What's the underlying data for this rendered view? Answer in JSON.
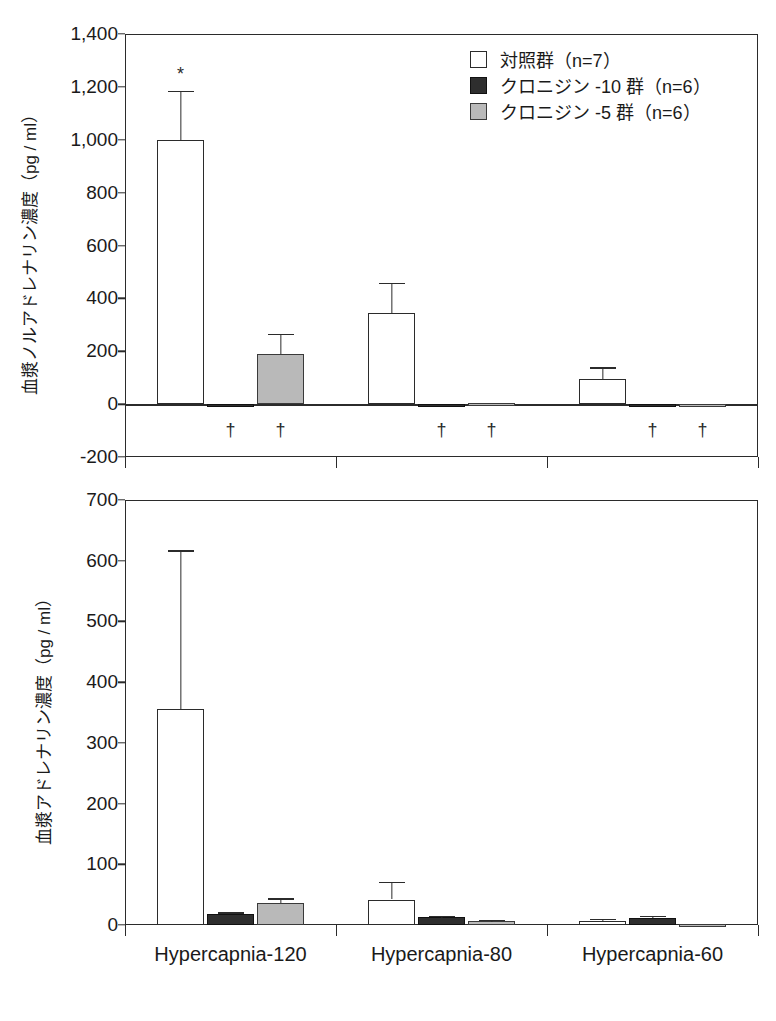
{
  "figure": {
    "series": [
      {
        "key": "control",
        "label": "対照群（n=7）",
        "swatch": "white-square-icon",
        "color": "#ffffff"
      },
      {
        "key": "c10",
        "label": "クロニジン -10 群（n=6）",
        "swatch": "black-square-icon",
        "color": "#2e2e2e"
      },
      {
        "key": "c5",
        "label": "クロニジン -5 群（n=6）",
        "swatch": "gray-square-icon",
        "color": "#b9b9b9"
      }
    ],
    "categories": [
      "Hypercapnia-120",
      "Hypercapnia-80",
      "Hypercapnia-60"
    ]
  },
  "chart_data": [
    {
      "type": "bar",
      "id": "noradrenaline",
      "title": "",
      "ylabel": "血漿ノルアドレナリン濃度（pg / ml）",
      "xlabel": "",
      "ylim": [
        -200,
        1400
      ],
      "yticks": [
        "1,400",
        "1,200",
        "1,000",
        "800",
        "600",
        "400",
        "200",
        "0",
        "-200"
      ],
      "ytick_values": [
        1400,
        1200,
        1000,
        800,
        600,
        400,
        200,
        0,
        -200
      ],
      "grid": false,
      "legend_position": "top-right",
      "categories": [
        "Hypercapnia-120",
        "Hypercapnia-80",
        "Hypercapnia-60"
      ],
      "series": [
        {
          "name": "対照群（n=7）",
          "key": "control",
          "values": [
            1000,
            345,
            95
          ],
          "errors": [
            185,
            113,
            45
          ],
          "annotations": [
            "*",
            "",
            ""
          ]
        },
        {
          "name": "クロニジン -10 群（n=6）",
          "key": "c10",
          "values": [
            -6,
            -5,
            -8
          ],
          "errors": [
            0,
            0,
            0
          ],
          "annotations": [
            "†",
            "†",
            "†"
          ]
        },
        {
          "name": "クロニジン -5 群（n=6）",
          "key": "c5",
          "values": [
            190,
            3,
            -5
          ],
          "errors": [
            75,
            0,
            0
          ],
          "annotations": [
            "†",
            "†",
            "†"
          ]
        }
      ]
    },
    {
      "type": "bar",
      "id": "adrenaline",
      "title": "",
      "ylabel": "血漿アドレナリン濃度（pg / ml）",
      "xlabel": "",
      "ylim": [
        0,
        700
      ],
      "yticks": [
        "700",
        "600",
        "500",
        "400",
        "300",
        "200",
        "100",
        "0"
      ],
      "ytick_values": [
        700,
        600,
        500,
        400,
        300,
        200,
        100,
        0
      ],
      "grid": false,
      "legend_position": "none",
      "categories": [
        "Hypercapnia-120",
        "Hypercapnia-80",
        "Hypercapnia-60"
      ],
      "series": [
        {
          "name": "対照群（n=7）",
          "key": "control",
          "values": [
            355,
            42,
            7
          ],
          "errors": [
            262,
            29,
            3
          ],
          "annotations": [
            "",
            "",
            ""
          ]
        },
        {
          "name": "クロニジン -10 群（n=6）",
          "key": "c10",
          "values": [
            18,
            13,
            12
          ],
          "errors": [
            3,
            2,
            3
          ],
          "annotations": [
            "",
            "",
            ""
          ]
        },
        {
          "name": "クロニジン -5 群（n=6）",
          "key": "c5",
          "values": [
            36,
            7,
            2
          ],
          "errors": [
            8,
            2,
            0
          ],
          "annotations": [
            "",
            "",
            ""
          ]
        }
      ]
    }
  ]
}
